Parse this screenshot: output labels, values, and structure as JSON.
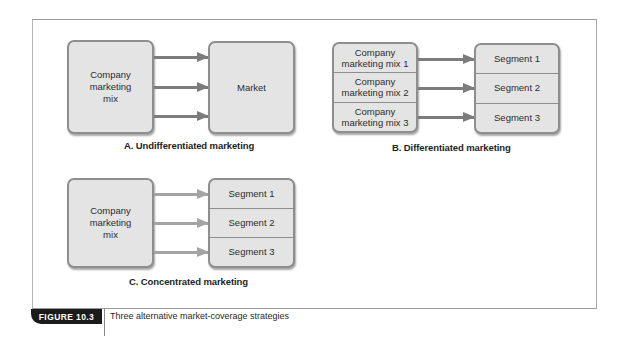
{
  "figure": {
    "number_label": "FIGURE 10.3",
    "caption": "Three alternative market-coverage strategies"
  },
  "panels": {
    "a": {
      "title": "A. Undifferentiated marketing",
      "source": "Company\nmarketing\nmix",
      "target": "Market",
      "arrow_count": 3
    },
    "b": {
      "title": "B. Differentiated marketing",
      "sources": [
        "Company marketing mix 1",
        "Company marketing mix 2",
        "Company marketing mix 3"
      ],
      "targets": [
        "Segment 1",
        "Segment 2",
        "Segment 3"
      ],
      "arrow_count": 3
    },
    "c": {
      "title": "C. Concentrated marketing",
      "source": "Company\nmarketing\nmix",
      "targets": [
        "Segment 1",
        "Segment 2",
        "Segment 3"
      ],
      "arrow_count": 3
    }
  },
  "colors": {
    "box_fill": "#e4e4e4",
    "box_border": "#8e8e8e",
    "arrow_dark": "#7c7c7c",
    "arrow_light": "#a4a4a4",
    "badge_bg": "#1b1b1b"
  }
}
